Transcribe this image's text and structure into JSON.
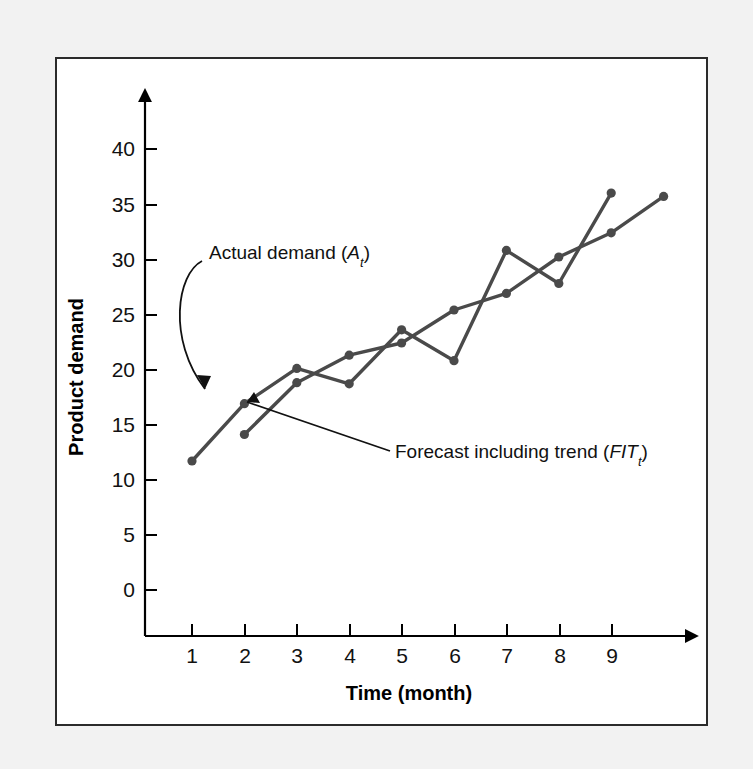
{
  "figure": {
    "background_color": "#f2f2f2",
    "panel_color": "#ffffff",
    "border_color": "#2b2b2b"
  },
  "annotations": {
    "actual_label_main": "Actual demand (",
    "actual_label_symbol": "A",
    "actual_label_sub": "t",
    "actual_label_close": ")",
    "actual_label_full": "Actual demand (At)",
    "forecast_label_main": "Forecast including trend (",
    "forecast_label_symbol": "FIT",
    "forecast_label_sub": "t",
    "forecast_label_close": ")",
    "forecast_label_full": "Forecast including trend (FITt)"
  },
  "chart_data": {
    "type": "line",
    "title": "",
    "xlabel": "Time (month)",
    "ylabel": "Product demand",
    "x": [
      1,
      2,
      3,
      4,
      5,
      6,
      7,
      8,
      9
    ],
    "xticklabels": [
      "1",
      "2",
      "3",
      "4",
      "5",
      "6",
      "7",
      "8",
      "9"
    ],
    "yticks": [
      0,
      5,
      10,
      15,
      20,
      25,
      30,
      35,
      40
    ],
    "yticklabels": [
      "0",
      "5",
      "10",
      "15",
      "20",
      "25",
      "30",
      "35",
      "40"
    ],
    "xlim": [
      0.4,
      10.1
    ],
    "ylim": [
      -2.5,
      43.5
    ],
    "grid": false,
    "legend": "none",
    "line_color": "#4a4a4a",
    "marker_color": "#4a4a4a",
    "series": [
      {
        "name": "Actual demand (At)",
        "values": [
          11.7,
          16.9,
          20.1,
          18.7,
          23.6,
          20.8,
          30.8,
          27.8,
          36.0
        ]
      },
      {
        "name": "Forecast including trend (FITt)",
        "x": [
          2,
          3,
          4,
          5,
          6,
          7,
          8,
          9,
          10
        ],
        "values": [
          14.1,
          18.8,
          21.3,
          22.4,
          25.4,
          26.9,
          30.2,
          32.4,
          35.7
        ]
      }
    ]
  }
}
